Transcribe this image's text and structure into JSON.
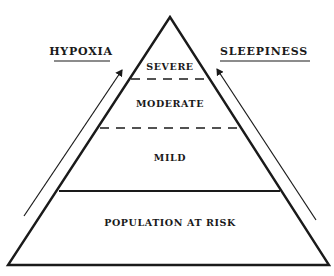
{
  "diagram": {
    "type": "pyramid",
    "left_axis": {
      "label": "HYPOXIA",
      "direction": "up"
    },
    "right_axis": {
      "label": "SLEEPINESS",
      "direction": "up"
    },
    "levels": [
      {
        "label": "SEVERE",
        "position": "top",
        "divider_below": "dashed"
      },
      {
        "label": "MODERATE",
        "position": "upper-middle",
        "divider_below": "dashed"
      },
      {
        "label": "MILD",
        "position": "lower-middle",
        "divider_below": "solid"
      },
      {
        "label": "POPULATION AT RISK",
        "position": "base"
      }
    ],
    "colors": {
      "ink": "#1a1a1a",
      "background": "#ffffff"
    }
  }
}
